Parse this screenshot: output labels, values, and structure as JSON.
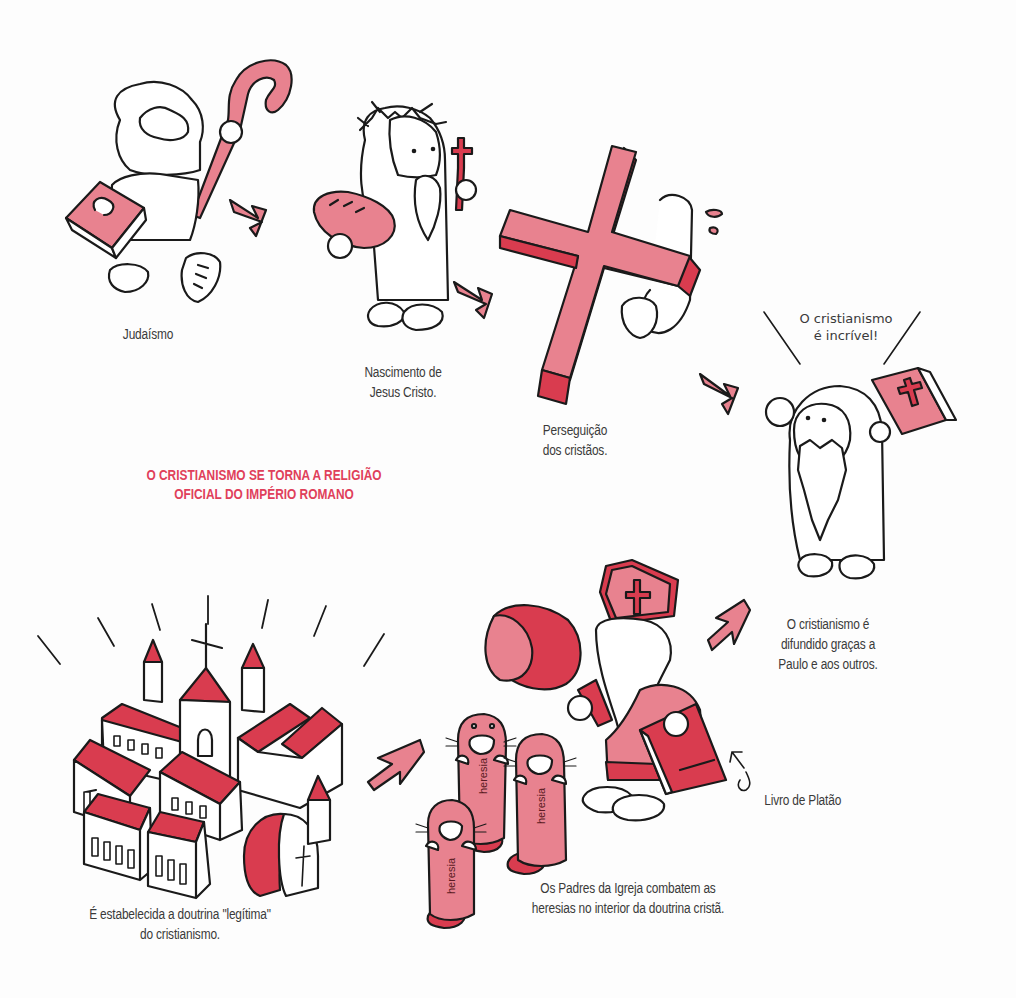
{
  "illustration": {
    "title": "Desenvolvimento do cristianismo",
    "colors": {
      "accent_red": "#e0405a",
      "pink_fill": "#e8828f",
      "dark_red_fill": "#d93c4f",
      "line": "#1a1a1a",
      "text": "#3a3a3a",
      "background": "#fdfdfd"
    },
    "scenes": [
      {
        "id": "judaismo",
        "caption_lines": [
          "Judaísmo"
        ]
      },
      {
        "id": "nascimento",
        "caption_lines": [
          "Nascimento de",
          "Jesus Cristo."
        ]
      },
      {
        "id": "perseguicao",
        "caption_lines": [
          "Perseguição",
          "dos cristãos."
        ]
      },
      {
        "id": "paulo",
        "speech_lines": [
          "O cristianismo",
          "é incrível!"
        ],
        "caption_lines": [
          "O cristianismo é",
          "difundido graças a",
          "Paulo e aos outros."
        ]
      },
      {
        "id": "padres",
        "caption_lines": [
          "Os Padres da Igreja combatem as",
          "heresias no interior da doutrina cristã."
        ],
        "book_label": "Livro de Platão",
        "mole_label": "heresia"
      },
      {
        "id": "doutrina",
        "caption_lines": [
          "É estabelecida a doutrina \"legítima\"",
          "do cristianismo."
        ]
      }
    ],
    "headline_lines": [
      "O CRISTIANISMO SE TORNA A RELIGIÃO",
      "OFICIAL DO IMPÉRIO ROMANO"
    ]
  }
}
